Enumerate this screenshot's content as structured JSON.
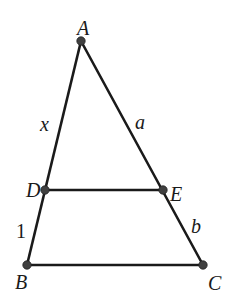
{
  "diagram": {
    "type": "geometry",
    "points": {
      "A": {
        "label": "A",
        "x": 81,
        "y": 41,
        "lx": 77,
        "ly": 35
      },
      "D": {
        "label": "D",
        "x": 45,
        "y": 190,
        "lx": 26,
        "ly": 197
      },
      "E": {
        "label": "E",
        "x": 163,
        "y": 190,
        "lx": 170,
        "ly": 201
      },
      "B": {
        "label": "B",
        "x": 27,
        "y": 265,
        "lx": 15,
        "ly": 289
      },
      "C": {
        "label": "C",
        "x": 203,
        "y": 265,
        "lx": 208,
        "ly": 290
      }
    },
    "segment_labels": {
      "AD": {
        "text": "x",
        "lx": 40,
        "ly": 131
      },
      "AE": {
        "text": "a",
        "lx": 135,
        "ly": 129
      },
      "DB": {
        "text": "1",
        "lx": 16,
        "ly": 238
      },
      "EC": {
        "text": "b",
        "lx": 191,
        "ly": 233
      }
    },
    "segments": [
      [
        "A",
        "B"
      ],
      [
        "A",
        "C"
      ],
      [
        "D",
        "E"
      ],
      [
        "B",
        "C"
      ]
    ],
    "colors": {
      "line": "#1a1a1a",
      "point": "#404040",
      "background": "#ffffff"
    }
  }
}
